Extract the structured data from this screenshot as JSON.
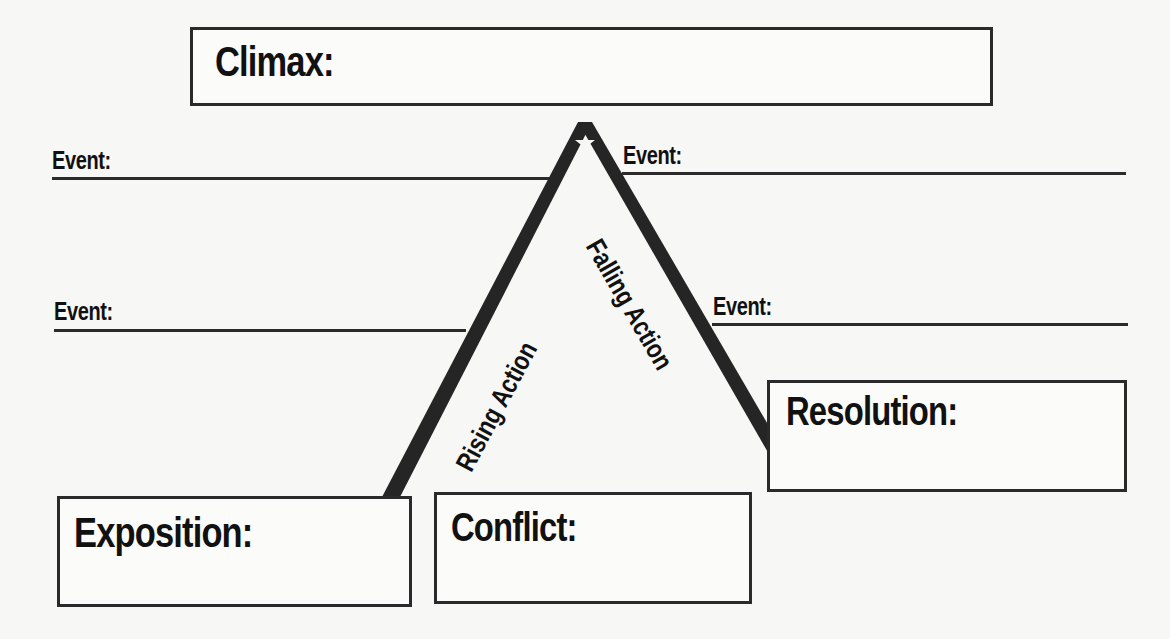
{
  "boxes": {
    "climax": {
      "label": "Climax:",
      "value": ""
    },
    "exposition": {
      "label": "Exposition:",
      "value": ""
    },
    "conflict": {
      "label": "Conflict:",
      "value": ""
    },
    "resolution": {
      "label": "Resolution:",
      "value": ""
    }
  },
  "events": {
    "left": [
      {
        "label": "Event:",
        "value": ""
      },
      {
        "label": "Event:",
        "value": ""
      }
    ],
    "right": [
      {
        "label": "Event:",
        "value": ""
      },
      {
        "label": "Event:",
        "value": ""
      }
    ]
  },
  "arms": {
    "rising": "Rising Action",
    "falling": "Falling Action"
  },
  "colors": {
    "ink": "#141414",
    "paper": "#f7f7f5",
    "line": "#2b2b2b"
  }
}
